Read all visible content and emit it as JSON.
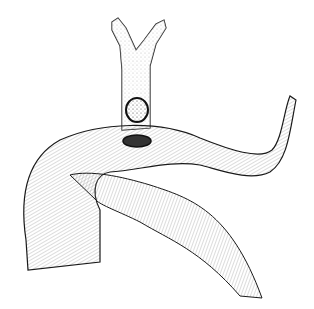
{
  "illustration": {
    "subject": "anatomical line drawing: bifurcated duct above a curved tubular organ with two openings",
    "background": "#ffffff",
    "ink": "#1a1a1a",
    "hatch": "#6a6a6a"
  }
}
